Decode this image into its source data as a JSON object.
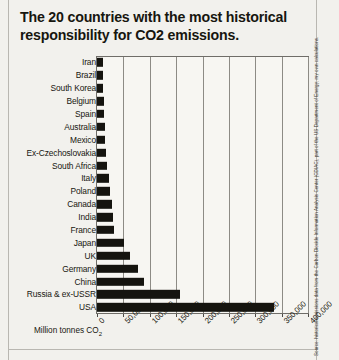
{
  "title": {
    "line1": "The 20 countries with the most historical",
    "line2": "responsibility for CO2 emissions."
  },
  "axis_title": "Million tonnes CO",
  "axis_title_sub": "2",
  "source_note": "Source: historical emissions data from the Carbon Dioxide Information Analysis Center (CDIAC), part of the US Department of Energy; my own calculations.",
  "chart_data": {
    "type": "bar",
    "orientation": "horizontal",
    "title": "The 20 countries with the most historical responsibility for CO2 emissions.",
    "xlabel": "Million tonnes CO2",
    "ylabel": "",
    "xlim": [
      0,
      400000
    ],
    "grid": true,
    "legend": "none",
    "tick_labels": [
      "0",
      "50,000",
      "100,000",
      "150,000",
      "200,000",
      "250,000",
      "300,000",
      "350,000",
      "400,000"
    ],
    "tick_values": [
      0,
      50000,
      100000,
      150000,
      200000,
      250000,
      300000,
      350000,
      400000
    ],
    "categories": [
      "Iran",
      "Brazil",
      "South Korea",
      "Belgium",
      "Spain",
      "Australia",
      "Mexico",
      "Ex-Czechoslovakia",
      "South Africa",
      "Italy",
      "Poland",
      "Canada",
      "India",
      "France",
      "Japan",
      "UK",
      "Germany",
      "China",
      "Russia & ex-USSR",
      "USA"
    ],
    "values": [
      11000,
      11500,
      12000,
      13500,
      14000,
      15500,
      16000,
      17000,
      18500,
      23500,
      25500,
      27500,
      30500,
      31500,
      51500,
      62500,
      77000,
      90000,
      157000,
      335000
    ]
  }
}
